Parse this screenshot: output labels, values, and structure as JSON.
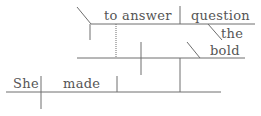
{
  "diagram": {
    "type": "sentence-diagram",
    "sentence": "She made the bold question to answer",
    "words": {
      "subject": "She",
      "verb": "made",
      "infinitive": "to answer",
      "object": "question",
      "article": "the",
      "adjective": "bold"
    },
    "colors": {
      "line": "#6e6e6e",
      "text": "#555555",
      "background": "#ffffff"
    }
  }
}
